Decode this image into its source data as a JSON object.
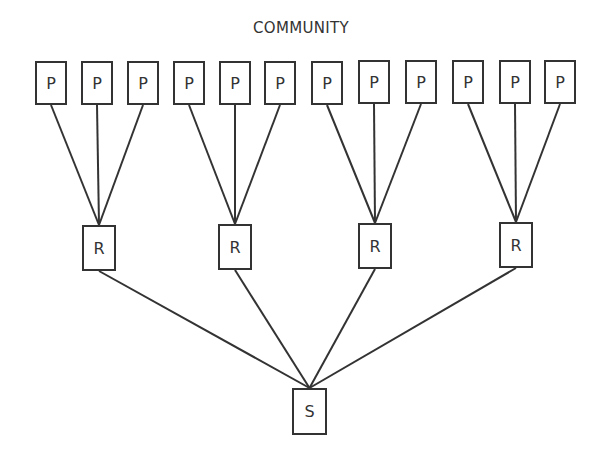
{
  "title": "COMMUNITY",
  "colors": {
    "stroke": "#333333",
    "background": "#ffffff"
  },
  "levels": {
    "top": {
      "label": "P",
      "count": 12
    },
    "middle": {
      "label": "R",
      "count": 4
    },
    "bottom": {
      "label": "S",
      "count": 1
    }
  },
  "nodes": {
    "p": [
      {
        "label": "P",
        "x": 35,
        "y": 61
      },
      {
        "label": "P",
        "x": 81,
        "y": 61
      },
      {
        "label": "P",
        "x": 127,
        "y": 61
      },
      {
        "label": "P",
        "x": 173,
        "y": 61
      },
      {
        "label": "P",
        "x": 219,
        "y": 61
      },
      {
        "label": "P",
        "x": 264,
        "y": 61
      },
      {
        "label": "P",
        "x": 311,
        "y": 61
      },
      {
        "label": "P",
        "x": 358,
        "y": 60
      },
      {
        "label": "P",
        "x": 405,
        "y": 60
      },
      {
        "label": "P",
        "x": 452,
        "y": 60
      },
      {
        "label": "P",
        "x": 499,
        "y": 60
      },
      {
        "label": "P",
        "x": 544,
        "y": 60
      }
    ],
    "r": [
      {
        "label": "R",
        "x": 82,
        "y": 225
      },
      {
        "label": "R",
        "x": 218,
        "y": 224
      },
      {
        "label": "R",
        "x": 358,
        "y": 223
      },
      {
        "label": "R",
        "x": 499,
        "y": 222
      }
    ],
    "s": [
      {
        "label": "S",
        "x": 292,
        "y": 388
      }
    ]
  },
  "edges": [
    {
      "from": "p0",
      "to": "r0"
    },
    {
      "from": "p1",
      "to": "r0"
    },
    {
      "from": "p2",
      "to": "r0"
    },
    {
      "from": "p3",
      "to": "r1"
    },
    {
      "from": "p4",
      "to": "r1"
    },
    {
      "from": "p5",
      "to": "r1"
    },
    {
      "from": "p6",
      "to": "r2"
    },
    {
      "from": "p7",
      "to": "r2"
    },
    {
      "from": "p8",
      "to": "r2"
    },
    {
      "from": "p9",
      "to": "r3"
    },
    {
      "from": "p10",
      "to": "r3"
    },
    {
      "from": "p11",
      "to": "r3"
    },
    {
      "from": "r0",
      "to": "s0"
    },
    {
      "from": "r1",
      "to": "s0"
    },
    {
      "from": "r2",
      "to": "s0"
    },
    {
      "from": "r3",
      "to": "s0"
    }
  ]
}
